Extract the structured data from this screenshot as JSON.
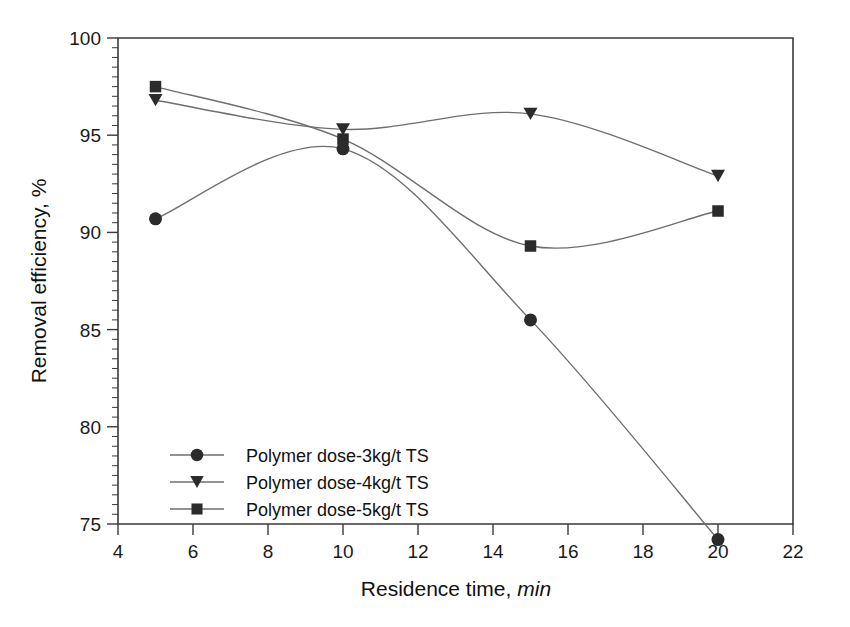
{
  "chart_data": {
    "type": "line",
    "title": "",
    "xlabel": "Residence time, min",
    "xlabel_main": "Residence time,",
    "xlabel_unit": "min",
    "ylabel": "Removal efficiency, %",
    "xlim": [
      4,
      22
    ],
    "ylim": [
      75,
      100
    ],
    "x_ticks": [
      4,
      6,
      8,
      10,
      12,
      14,
      16,
      18,
      20,
      22
    ],
    "y_ticks": [
      75,
      80,
      85,
      90,
      95,
      100
    ],
    "x_minor_step": 0,
    "y_minor_step": 0.5,
    "grid": false,
    "legend_position": "inside-lower-left",
    "x": [
      5,
      10,
      15,
      20
    ],
    "series": [
      {
        "name": "Polymer dose-3kg/t TS",
        "marker": "circle",
        "values": [
          90.7,
          94.3,
          85.5,
          74.2
        ]
      },
      {
        "name": "Polymer dose-4kg/t TS",
        "marker": "triangle-down",
        "values": [
          96.8,
          95.3,
          96.1,
          92.9
        ]
      },
      {
        "name": "Polymer dose-5kg/t TS",
        "marker": "square",
        "values": [
          97.5,
          94.8,
          89.3,
          91.1
        ]
      }
    ],
    "colors": {
      "line": "#6e6e6e",
      "marker": "#2b2b2b",
      "axis": "#3a3a3a",
      "text": "#1a1a1a",
      "background": "#ffffff"
    }
  }
}
